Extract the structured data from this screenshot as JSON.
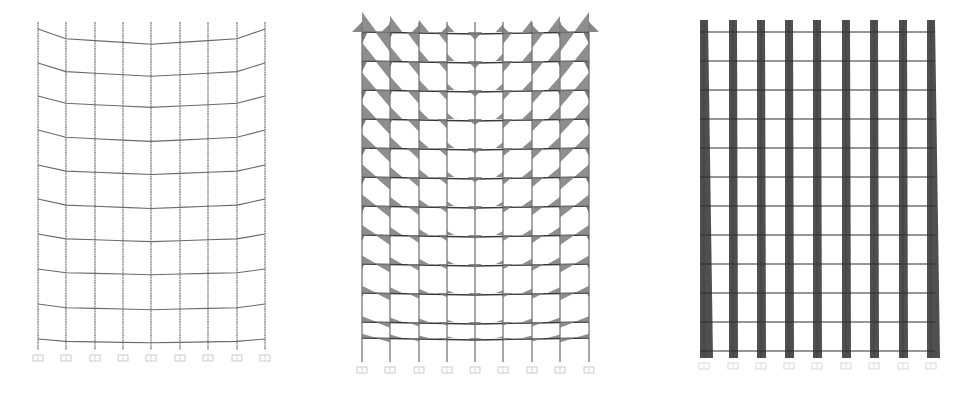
{
  "figure": {
    "type": "structural-frame-diagrams",
    "panels": [
      {
        "id": "deformed-shape",
        "description": "Deformed frame shape (10 storeys, 9 column lines)",
        "columns_x": [
          38,
          66,
          95,
          123,
          151,
          180,
          208,
          237,
          265
        ],
        "top_y": 22,
        "base_y": 350,
        "support_y": 355,
        "floors_edge_y": [
          29,
          63,
          96,
          130,
          165,
          199,
          234,
          269,
          304,
          339
        ],
        "sag": [
          8,
          7,
          6,
          6,
          5,
          5,
          4,
          3,
          3,
          2
        ],
        "line_color": "#6a6a6a"
      },
      {
        "id": "bending-moment",
        "description": "Bending moment diagram (12 storeys, 9 column lines)",
        "columns_x": [
          362,
          390,
          419,
          447,
          475,
          503,
          532,
          560,
          589
        ],
        "top_y": 22,
        "base_y": 362,
        "support_y": 367,
        "floors_y": [
          32,
          61,
          90,
          119,
          148,
          177,
          206,
          235,
          264,
          293,
          322,
          338
        ],
        "fill_color": "#7a7a7a",
        "line_color": "#3a3a3a"
      },
      {
        "id": "axial-force",
        "description": "Axial force diagram in columns (12 storeys, 9 column lines)",
        "columns_x": [
          704,
          733,
          761,
          789,
          817,
          846,
          874,
          903,
          931
        ],
        "top_y": 20,
        "base_y": 358,
        "support_y": 363,
        "floors_y": [
          32,
          61,
          90,
          119,
          148,
          177,
          206,
          235,
          264,
          293,
          322,
          351
        ],
        "bar_width_top": 8,
        "bar_width_bottom": 13,
        "fill_color": "#4f4f4f",
        "line_color": "#2f2f2f"
      }
    ]
  }
}
